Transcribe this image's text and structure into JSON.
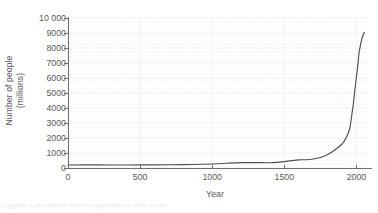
{
  "chart_data": {
    "type": "line",
    "title": "",
    "xlabel": "Year",
    "ylabel_line1": "Number of people",
    "ylabel_line2": "(millions)",
    "xlim": [
      0,
      2080
    ],
    "ylim": [
      0,
      10000
    ],
    "grid": true,
    "grid_minor": true,
    "legend": "none",
    "xticks": [
      0,
      500,
      1000,
      1500,
      2000
    ],
    "xtick_labels": [
      "0",
      "500",
      "1000",
      "1500",
      "2000"
    ],
    "yticks": [
      0,
      1000,
      2000,
      3000,
      4000,
      5000,
      6000,
      7000,
      8000,
      9000,
      10000
    ],
    "ytick_labels": [
      "0",
      "1000",
      "2000",
      "3000",
      "4000",
      "5000",
      "6000",
      "7000",
      "8000",
      "9000",
      "10 000"
    ],
    "series": [
      {
        "name": "World population",
        "x": [
          0,
          200,
          400,
          600,
          800,
          1000,
          1100,
          1200,
          1300,
          1400,
          1500,
          1600,
          1650,
          1700,
          1750,
          1800,
          1850,
          1900,
          1927,
          1950,
          1960,
          1970,
          1980,
          1990,
          2000,
          2010,
          2020,
          2040,
          2055
        ],
        "y": [
          200,
          205,
          200,
          210,
          225,
          265,
          320,
          360,
          360,
          350,
          425,
          545,
          550,
          600,
          700,
          900,
          1200,
          1600,
          2000,
          2500,
          3000,
          3700,
          4400,
          5300,
          6100,
          6900,
          7800,
          8700,
          9050
        ]
      }
    ]
  },
  "axes": {
    "y_axis_color": "#6d6e71",
    "x_axis_color": "#6d6e71",
    "grid_color": "#f4eef0",
    "grid_minor_color": "#faf7f8",
    "curve_color": "#4e4e50",
    "text_color": "#58595b"
  },
  "caption": {
    "clipped_line": "Figure    Estimated world population over time"
  }
}
